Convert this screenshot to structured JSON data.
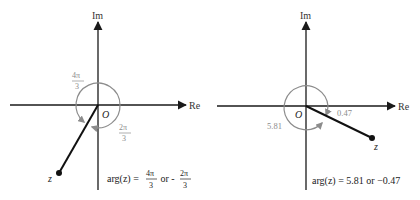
{
  "colors": {
    "axis": "#1a1a1a",
    "angle": "#8c8c8c",
    "segment": "#111111"
  },
  "left_diagram": {
    "axis_im_label": "Im",
    "axis_re_label": "Re",
    "origin_label": "O",
    "point_label": "z",
    "angle_positive": {
      "num": "4π",
      "den": "3"
    },
    "angle_negative": {
      "num": "2π",
      "den": "3"
    },
    "caption": {
      "prefix": "arg(z) = ",
      "frac1_num": "4π",
      "frac1_den": "3",
      "middle": " or -",
      "frac2_num": "2π",
      "frac2_den": "3"
    }
  },
  "right_diagram": {
    "axis_im_label": "Im",
    "axis_re_label": "Re",
    "origin_label": "O",
    "point_label": "z",
    "angle_positive": "5.81",
    "angle_negative": "0.47",
    "caption": "arg(z) = 5.81 or −0.47"
  }
}
